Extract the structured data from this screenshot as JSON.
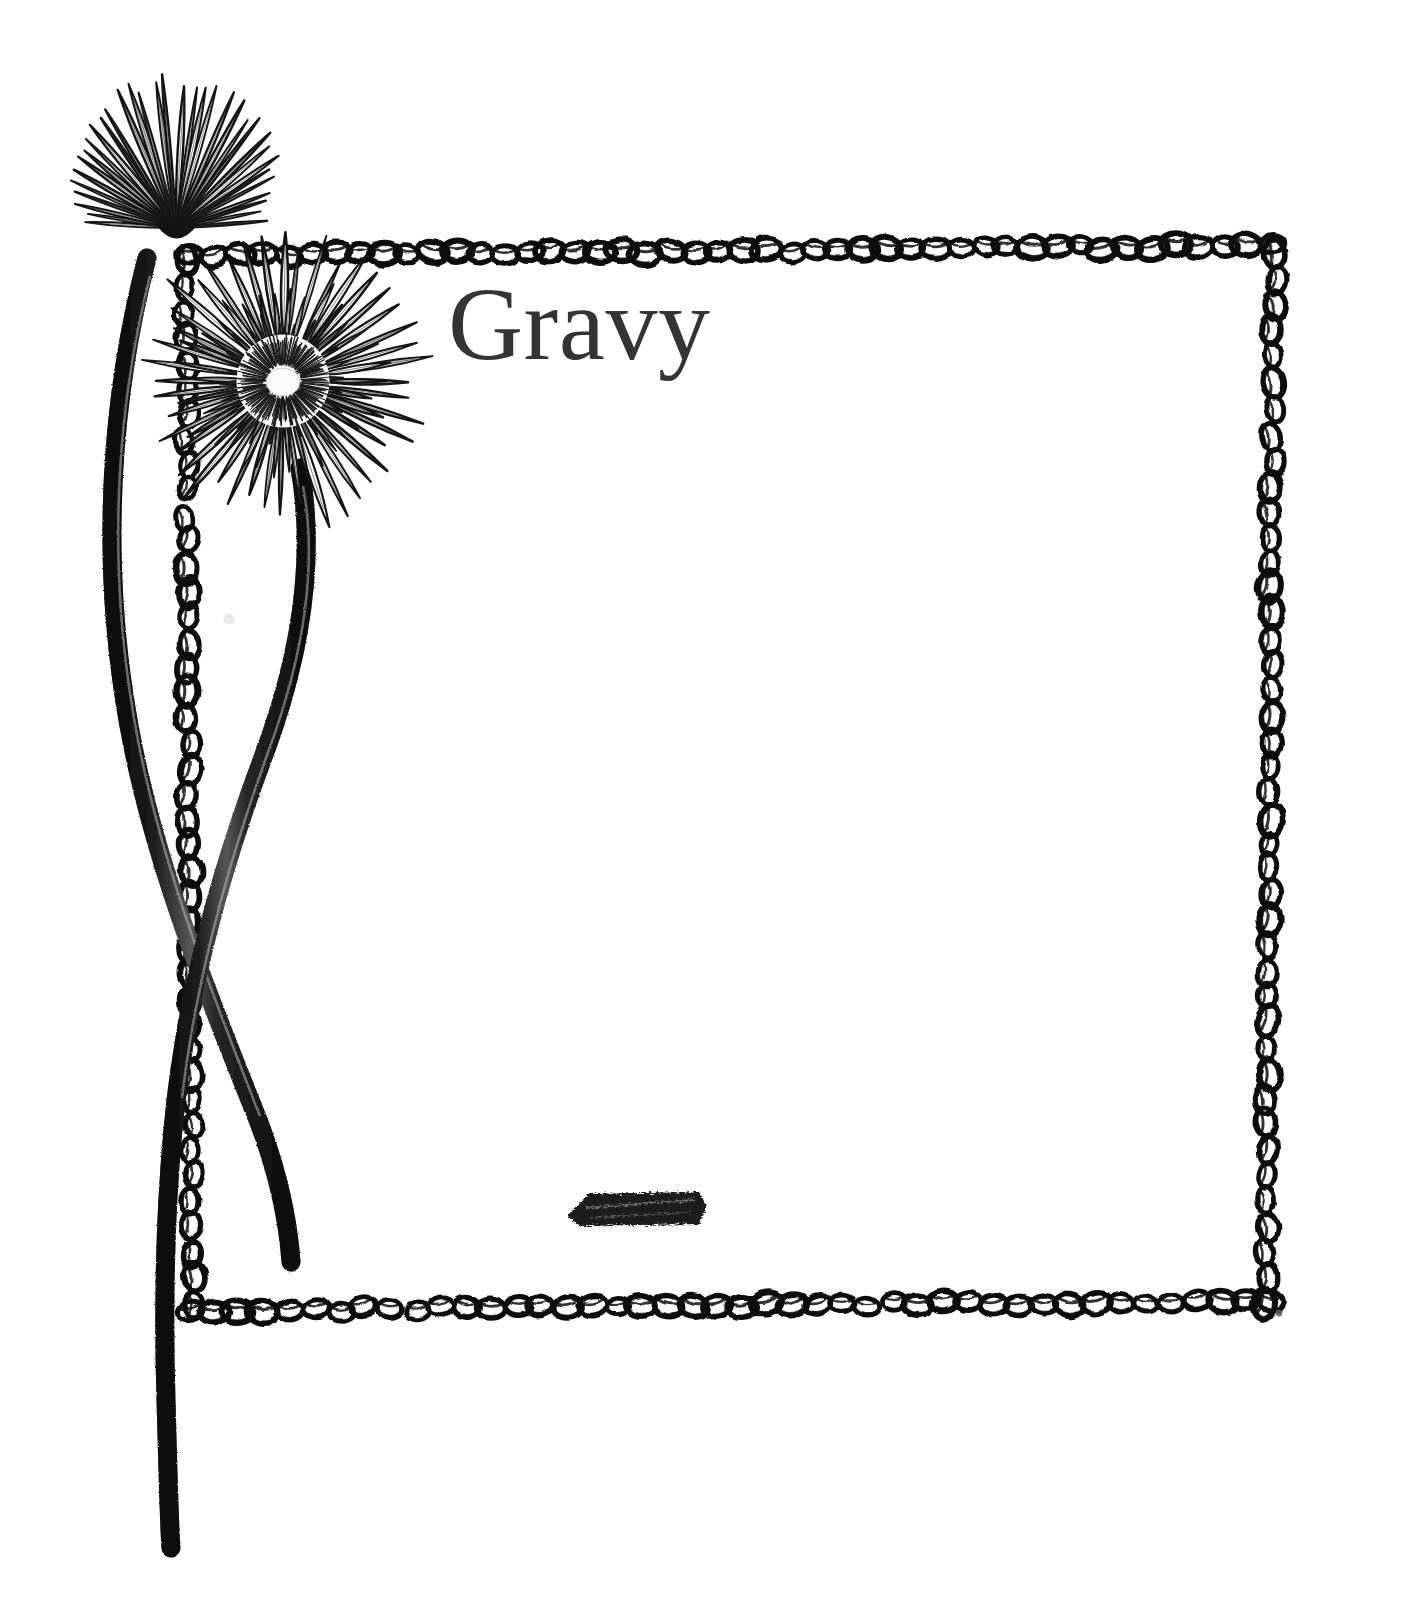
{
  "page": {
    "kind": "scanned-cookbook-section-divider",
    "background_color": "#ffffff",
    "width": 1419,
    "height": 1624
  },
  "title": {
    "text": "Gravy",
    "color": "#343434",
    "x": 448,
    "y": 272,
    "font_size": 104,
    "style": "serif"
  },
  "frame": {
    "name": "hand-drawn-chain-border",
    "ink_color": "#111111",
    "left": 183,
    "top": 248,
    "right": 1272,
    "bottom": 1303,
    "loop_style": "interlocking-oval-loops",
    "stroke_width": 6,
    "loop_count_top": 46,
    "loop_count_bottom": 44,
    "loop_count_left": 42,
    "loop_count_right": 42
  },
  "illustration": {
    "name": "gerbera-daisy-pen-and-ink-drawing",
    "ink_color": "#1a1a1a",
    "flowers": [
      {
        "name": "upper-flower-profile-view",
        "center_x": 150,
        "center_y": 176,
        "radius": 128,
        "petal_count": 34,
        "view": "side-profile"
      },
      {
        "name": "lower-flower-face-view",
        "center_x": 283,
        "center_y": 381,
        "radius": 140,
        "petal_count": 44,
        "view": "front-facing",
        "disc_radius": 30
      }
    ],
    "stems": [
      {
        "name": "left-stem",
        "from_x": 148,
        "from_y": 262,
        "to_x": 288,
        "to_y": 1260,
        "thickness": 17
      },
      {
        "name": "right-stem",
        "from_x": 300,
        "from_y": 470,
        "to_x": 170,
        "to_y": 1548,
        "thickness": 17
      }
    ]
  },
  "marks": [
    {
      "name": "ink-smudge-mark",
      "x": 566,
      "y": 1188,
      "width": 140,
      "height": 38,
      "color": "#1d1d1d"
    },
    {
      "name": "corner-speck-mark",
      "x": 1276,
      "y": 1310,
      "width": 7,
      "height": 7,
      "color": "#555555"
    },
    {
      "name": "faint-paper-spot",
      "x": 224,
      "y": 614,
      "width": 10,
      "height": 10,
      "color": "#e6e2e2"
    }
  ]
}
